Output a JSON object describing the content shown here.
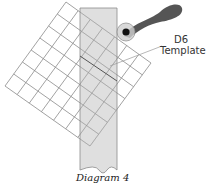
{
  "diagram": {
    "label_line1": "D6",
    "label_line2": "Template",
    "caption": "Diagram 4",
    "grid": {
      "cells": 7,
      "corners": {
        "top": [
          66,
          2
        ],
        "left": [
          5,
          86
        ],
        "bottom": [
          90,
          146
        ],
        "right": [
          151,
          63
        ]
      }
    },
    "colors": {
      "grid_line": "#8a8a8a",
      "strip_fill": "#d4d4d4",
      "strip_stroke": "#8a8a8a",
      "handle": "#555555",
      "pivot_ring": "#cccccc",
      "pivot_dot": "#111111",
      "leader": "#999999"
    }
  }
}
